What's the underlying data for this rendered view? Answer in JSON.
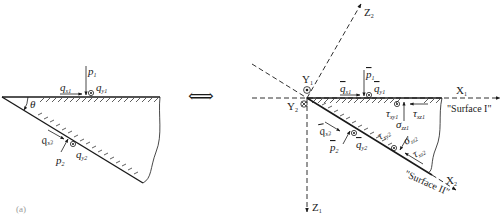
{
  "figure": {
    "panel_label": "(a)",
    "equivalence_symbol": "⟺"
  },
  "left_panel": {
    "angle_label": "θ",
    "top_surface": {
      "p": {
        "base": "p",
        "sub": "1"
      },
      "qx": {
        "base": "q",
        "sub": "x1"
      },
      "qy": {
        "base": "q",
        "sub": "y1"
      }
    },
    "bottom_surface": {
      "p": {
        "base": "p",
        "sub": "2"
      },
      "qx": {
        "base": "q",
        "sub": "x2"
      },
      "qy": {
        "base": "q",
        "sub": "y2"
      }
    }
  },
  "right_panel": {
    "axes": {
      "x1": {
        "base": "X",
        "sub": "1"
      },
      "z1": {
        "base": "Z",
        "sub": "1"
      },
      "x2": {
        "base": "X",
        "sub": "2"
      },
      "z2": {
        "base": "Z",
        "sub": "2"
      },
      "y1": {
        "base": "Y",
        "sub": "1"
      },
      "y2": {
        "base": "Y",
        "sub": "2"
      }
    },
    "surface_1": {
      "name": "\"Surface I\"",
      "p": {
        "base": "p",
        "sub": "1"
      },
      "qx": {
        "base": "q",
        "sub": "x1"
      },
      "qy": {
        "base": "q",
        "sub": "y1"
      },
      "tau_xy": {
        "base": "τ",
        "sub": "xy1"
      },
      "tau_xz": {
        "base": "τ",
        "sub": "xz1"
      },
      "sigma": {
        "base": "σ",
        "sub": "zz1"
      }
    },
    "surface_2": {
      "name": "\"Surface II\"",
      "p": {
        "base": "p",
        "sub": "2"
      },
      "qx": {
        "base": "q",
        "sub": "x2"
      },
      "qy": {
        "base": "q",
        "sub": "y2"
      },
      "tau_xy": {
        "base": "τ",
        "sub": "xy2"
      },
      "tau_xz": {
        "base": "τ",
        "sub": "xz2"
      },
      "sigma": {
        "base": "σ",
        "sub": "zz2"
      }
    }
  }
}
